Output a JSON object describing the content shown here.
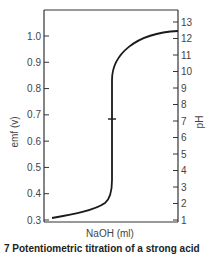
{
  "chart_data": {
    "type": "line",
    "title": "",
    "xlabel": "NaOH (ml)",
    "ylabel": "emf (v)",
    "ylabel_right": "pH",
    "ylim": [
      0.3,
      1.08
    ],
    "yticks": [
      0.3,
      0.4,
      0.5,
      0.6,
      0.7,
      0.8,
      0.9,
      1.0
    ],
    "ytick_labels": [
      "0.3",
      "0.4",
      "0.5",
      "0.6",
      "0.7",
      "0.8",
      "0.9",
      "1.0"
    ],
    "y2lim": [
      0.85,
      13.8
    ],
    "y2ticks": [
      1,
      2,
      3,
      4,
      5,
      6,
      7,
      8,
      9,
      10,
      11,
      12,
      13
    ],
    "y2tick_labels": [
      "1",
      "2",
      "3",
      "4",
      "5",
      "6",
      "7",
      "8",
      "9",
      "10",
      "11",
      "12",
      "13"
    ],
    "xticks": [],
    "grid": false,
    "legend": null,
    "annotations": [
      {
        "type": "equivalence-point-mark",
        "emf": 0.69,
        "pH": 7
      }
    ],
    "series": [
      {
        "name": "titration curve",
        "x_relative": [
          0.06,
          0.2,
          0.35,
          0.45,
          0.48,
          0.5,
          0.5,
          0.5,
          0.5,
          0.52,
          0.58,
          0.68,
          0.8,
          0.92,
          1.0
        ],
        "emf": [
          0.31,
          0.33,
          0.36,
          0.39,
          0.42,
          0.46,
          0.6,
          0.69,
          0.85,
          0.9,
          0.95,
          0.985,
          1.005,
          1.015,
          1.02
        ]
      }
    ]
  },
  "caption": "7 Potentiometric titration of a strong acid"
}
